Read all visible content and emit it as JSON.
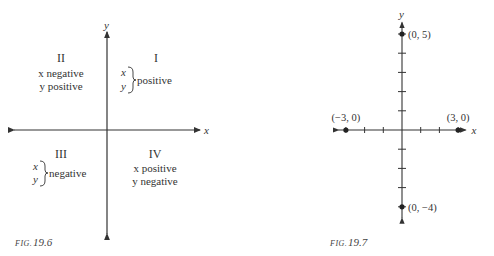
{
  "figures": [
    {
      "caption_prefix": "FIG.",
      "caption_number": "19.6",
      "x_axis_label": "x",
      "y_axis_label": "y",
      "quadrants": [
        {
          "numeral": "I",
          "line1": "x",
          "line2": "y",
          "brace_text": "positive",
          "style": "brace"
        },
        {
          "numeral": "II",
          "line1": "x negative",
          "line2": "y positive",
          "style": "lines"
        },
        {
          "numeral": "III",
          "line1": "x",
          "line2": "y",
          "brace_text": "negative",
          "style": "brace"
        },
        {
          "numeral": "IV",
          "line1": "x positive",
          "line2": "y negative",
          "style": "lines"
        }
      ]
    },
    {
      "caption_prefix": "FIG.",
      "caption_number": "19.7",
      "x_axis_label": "x",
      "y_axis_label": "y"
    }
  ],
  "chart_data": {
    "type": "scatter",
    "title": "FIG. 19.7",
    "xlabel": "x",
    "ylabel": "y",
    "xlim": [
      -3.4,
      3.4
    ],
    "ylim": [
      -4.6,
      5.6
    ],
    "x_ticks": [
      -3,
      -2,
      -1,
      1,
      2,
      3
    ],
    "y_ticks": [
      -4,
      -3,
      -2,
      -1,
      1,
      2,
      3,
      4,
      5
    ],
    "grid": false,
    "points": [
      {
        "x": 0,
        "y": 5,
        "label": "(0, 5)"
      },
      {
        "x": -3,
        "y": 0,
        "label": "(−3, 0)"
      },
      {
        "x": 3,
        "y": 0,
        "label": "(3, 0)"
      },
      {
        "x": 0,
        "y": -4,
        "label": "(0, −4)"
      }
    ]
  }
}
